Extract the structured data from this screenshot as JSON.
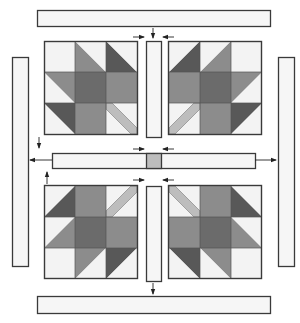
{
  "diagram": {
    "colors": {
      "white": "#f3f3f3",
      "light": "#bdbdbd",
      "medium": "#8c8c8c",
      "center": "#6b6b6b",
      "dark": "#585858",
      "outline": "#3a3a3a",
      "strip": "#f6f6f6",
      "arrow": "#222222"
    },
    "cell_size": 31,
    "blocks": [
      {
        "name": "block-top-left",
        "x": 44,
        "y": 41,
        "flipX": false,
        "flipY": false
      },
      {
        "name": "block-top-right",
        "x": 169,
        "y": 41,
        "flipX": true,
        "flipY": false
      },
      {
        "name": "block-bottom-left",
        "x": 44,
        "y": 186,
        "flipX": false,
        "flipY": true
      },
      {
        "name": "block-bottom-right",
        "x": 169,
        "y": 186,
        "flipX": true,
        "flipY": true
      }
    ],
    "block_pattern": [
      [
        {
          "type": "solid",
          "fill": "white"
        },
        {
          "type": "diag",
          "lower": "medium",
          "upper": "white"
        },
        {
          "type": "diag",
          "lower": "dark",
          "upper": "white"
        }
      ],
      [
        {
          "type": "diag",
          "lower": "white",
          "upper": "medium"
        },
        {
          "type": "solid",
          "fill": "center"
        },
        {
          "type": "solid",
          "fill": "medium"
        }
      ],
      [
        {
          "type": "diag",
          "lower": "white",
          "upper": "dark"
        },
        {
          "type": "solid",
          "fill": "medium"
        },
        {
          "type": "stripe",
          "fill": "white",
          "stripe": "light"
        }
      ]
    ],
    "strips": [
      {
        "name": "top-border-strip",
        "x": 37,
        "y": 10,
        "w": 233,
        "h": 16
      },
      {
        "name": "bottom-border-strip",
        "x": 37,
        "y": 296,
        "w": 233,
        "h": 17
      },
      {
        "name": "left-border-strip",
        "x": 12,
        "y": 57,
        "w": 16,
        "h": 209
      },
      {
        "name": "right-border-strip",
        "x": 278,
        "y": 57,
        "w": 16,
        "h": 209
      },
      {
        "name": "center-horizontal-sashing",
        "x": 52,
        "y": 153,
        "w": 203,
        "h": 15
      },
      {
        "name": "top-vertical-sashing",
        "x": 146,
        "y": 41,
        "w": 15,
        "h": 96
      },
      {
        "name": "bottom-vertical-sashing",
        "x": 146,
        "y": 186,
        "w": 15,
        "h": 95
      }
    ],
    "cornerstone": {
      "name": "center-cornerstone",
      "x": 146,
      "y": 153,
      "w": 15,
      "h": 15
    },
    "arrows": [
      {
        "name": "arrow-top-strip-down",
        "x1": 153,
        "y1": 28,
        "x2": 153,
        "y2": 38
      },
      {
        "name": "arrow-top-sashing-right",
        "x1": 133,
        "y1": 37,
        "x2": 144,
        "y2": 37
      },
      {
        "name": "arrow-top-sashing-left",
        "x1": 174,
        "y1": 37,
        "x2": 163,
        "y2": 37
      },
      {
        "name": "arrow-center-top-right",
        "x1": 133,
        "y1": 149,
        "x2": 144,
        "y2": 149
      },
      {
        "name": "arrow-center-top-left",
        "x1": 174,
        "y1": 149,
        "x2": 163,
        "y2": 149
      },
      {
        "name": "arrow-center-bottom-right",
        "x1": 133,
        "y1": 180,
        "x2": 144,
        "y2": 180
      },
      {
        "name": "arrow-center-bottom-left",
        "x1": 174,
        "y1": 180,
        "x2": 163,
        "y2": 180
      },
      {
        "name": "arrow-left-down",
        "x1": 39,
        "y1": 137,
        "x2": 39,
        "y2": 148
      },
      {
        "name": "arrow-left-up",
        "x1": 47,
        "y1": 184,
        "x2": 47,
        "y2": 172
      },
      {
        "name": "arrow-left-strip",
        "x1": 52,
        "y1": 160,
        "x2": 30,
        "y2": 160
      },
      {
        "name": "arrow-right-strip",
        "x1": 255,
        "y1": 160,
        "x2": 276,
        "y2": 160
      },
      {
        "name": "arrow-bottom-strip-down",
        "x1": 153,
        "y1": 283,
        "x2": 153,
        "y2": 294
      }
    ]
  }
}
